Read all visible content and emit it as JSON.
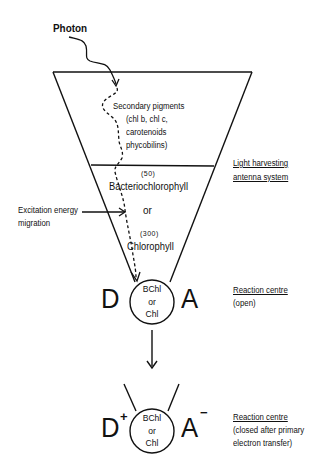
{
  "diagram": {
    "photon_label": "Photon",
    "antenna": {
      "secondary_pigments": {
        "line1": "Secondary pigments",
        "line2": "(chl b, chl c,",
        "line3": "carotenoids",
        "line4": "phycobilins)"
      },
      "bacteriochlorophyll_count": "(50)",
      "bacteriochlorophyll_label": "Bacteriochlorophyll",
      "or_label": "or",
      "chlorophyll_count": "(300)",
      "chlorophyll_label": "Chlorophyll"
    },
    "side_labels": {
      "light_harvesting_line1": "Light harvesting",
      "light_harvesting_line2": "antenna system",
      "excitation_line1": "Excitation energy",
      "excitation_line2": "migration"
    },
    "reaction_centre_open": {
      "donor": "D",
      "acceptor": "A",
      "core_line1": "BChl",
      "core_line2": "or",
      "core_line3": "Chl",
      "title": "Reaction centre",
      "state": "(open)"
    },
    "reaction_centre_closed": {
      "donor": "D",
      "donor_charge": "+",
      "acceptor": "A",
      "acceptor_charge": "−",
      "core_line1": "BChl",
      "core_line2": "or",
      "core_line3": "Chl",
      "title": "Reaction centre",
      "state_line1": "(closed after primary",
      "state_line2": "electron transfer)"
    }
  }
}
